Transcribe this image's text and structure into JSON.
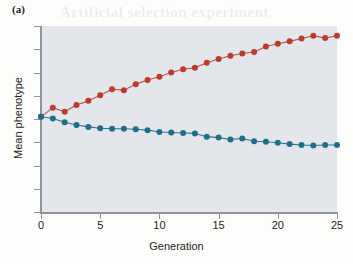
{
  "panel": {
    "label": "(a)"
  },
  "colors": {
    "plot_background": "#e3e7ec",
    "page_background": "#fdfdfc",
    "axis": "#8e9499",
    "series_up": "#c0392b",
    "series_up_line": "#b5534a",
    "series_down": "#1f6f8b",
    "series_down_line": "#3e6f85",
    "text": "#231f20"
  },
  "axes": {
    "x_ticks": [
      0,
      5,
      10,
      15,
      20,
      25
    ],
    "x_tick_labels": [
      "0",
      "5",
      "10",
      "15",
      "20",
      "25"
    ],
    "y_tick_count": 9
  },
  "bleed_text": {
    "line1": "Artificial selection experiment",
    "line2": "divergent response",
    "line3": "the mean phenotype of",
    "line4": "upward and downward lines",
    "line5": "over time"
  },
  "chart_data": {
    "type": "line",
    "title": "",
    "subtitle": "",
    "xlabel": "Generation",
    "ylabel": "Mean phenotype",
    "xlim": [
      0,
      25
    ],
    "ylim": [
      0,
      8
    ],
    "grid": false,
    "legend_position": "none",
    "x": [
      0,
      1,
      2,
      3,
      4,
      5,
      6,
      7,
      8,
      9,
      10,
      11,
      12,
      13,
      14,
      15,
      16,
      17,
      18,
      19,
      20,
      21,
      22,
      23,
      24,
      25
    ],
    "series": [
      {
        "name": "Upward-selected line",
        "color": "#c0392b",
        "marker": "circle",
        "values": [
          4.1,
          4.48,
          4.31,
          4.6,
          4.78,
          5.02,
          5.28,
          5.24,
          5.5,
          5.68,
          5.82,
          6.0,
          6.14,
          6.2,
          6.42,
          6.58,
          6.72,
          6.82,
          6.88,
          7.12,
          7.24,
          7.34,
          7.46,
          7.58,
          7.48,
          7.58
        ]
      },
      {
        "name": "Downward-selected line",
        "color": "#1f6f8b",
        "marker": "circle",
        "values": [
          4.1,
          4.02,
          3.86,
          3.74,
          3.66,
          3.6,
          3.58,
          3.58,
          3.56,
          3.52,
          3.44,
          3.42,
          3.4,
          3.38,
          3.24,
          3.2,
          3.12,
          3.16,
          3.04,
          3.02,
          2.98,
          2.92,
          2.88,
          2.86,
          2.88,
          2.88
        ]
      }
    ]
  }
}
